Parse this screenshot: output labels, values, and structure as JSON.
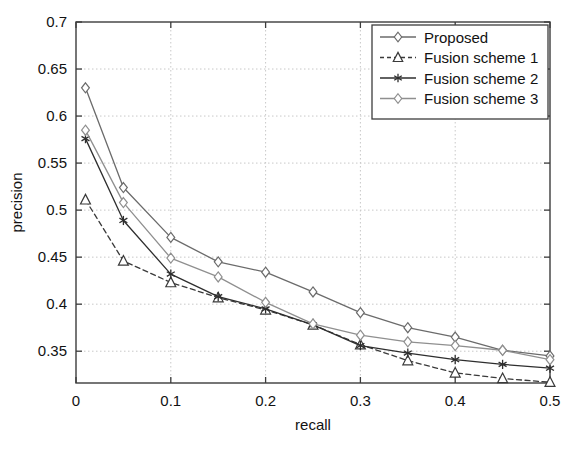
{
  "chart_data": {
    "type": "line",
    "title": "",
    "xlabel": "recall",
    "ylabel": "precision",
    "xlim": [
      0,
      0.5
    ],
    "ylim": [
      0.3162,
      0.7
    ],
    "xticks": [
      0,
      0.1,
      0.2,
      0.3,
      0.4,
      0.5
    ],
    "xtick_labels": [
      "0",
      "0.1",
      "0.2",
      "0.3",
      "0.4",
      "0.5"
    ],
    "yticks": [
      0.35,
      0.4,
      0.45,
      0.5,
      0.55,
      0.6,
      0.65,
      0.7
    ],
    "ytick_labels": [
      "0.35",
      "0.4",
      "0.45",
      "0.5",
      "0.55",
      "0.6",
      "0.65",
      "0.7"
    ],
    "grid": true,
    "legend_position": "top-right",
    "x": [
      0.01,
      0.05,
      0.1,
      0.15,
      0.2,
      0.25,
      0.3,
      0.35,
      0.4,
      0.45,
      0.5
    ],
    "series": [
      {
        "name": "Proposed",
        "marker": "diamond",
        "linestyle": "solid",
        "color": "#6b6b6b",
        "values": [
          0.63,
          0.524,
          0.471,
          0.445,
          0.434,
          0.413,
          0.391,
          0.375,
          0.365,
          0.351,
          0.345
        ]
      },
      {
        "name": "Fusion scheme 1",
        "marker": "triangle",
        "linestyle": "dashed",
        "color": "#3a3a3a",
        "values": [
          0.511,
          0.446,
          0.423,
          0.407,
          0.394,
          0.378,
          0.357,
          0.34,
          0.327,
          0.321,
          0.317
        ]
      },
      {
        "name": "Fusion scheme 2",
        "marker": "asterisk",
        "linestyle": "solid",
        "color": "#2e2e2e",
        "values": [
          0.576,
          0.489,
          0.432,
          0.408,
          0.395,
          0.378,
          0.356,
          0.348,
          0.341,
          0.336,
          0.332
        ]
      },
      {
        "name": "Fusion scheme 3",
        "marker": "diamond",
        "linestyle": "solid",
        "color": "#8f8f8f",
        "values": [
          0.585,
          0.508,
          0.449,
          0.429,
          0.402,
          0.379,
          0.367,
          0.36,
          0.356,
          0.351,
          0.341
        ]
      }
    ]
  },
  "caption": {
    "text": "      "
  },
  "legend": {
    "items": [
      "Proposed",
      "Fusion scheme 1",
      "Fusion scheme 2",
      "Fusion scheme 3"
    ]
  },
  "colors": {
    "axis": "#3d3d3d",
    "grid": "#c8c8c8",
    "background": "#ffffff",
    "text": "#121212"
  }
}
